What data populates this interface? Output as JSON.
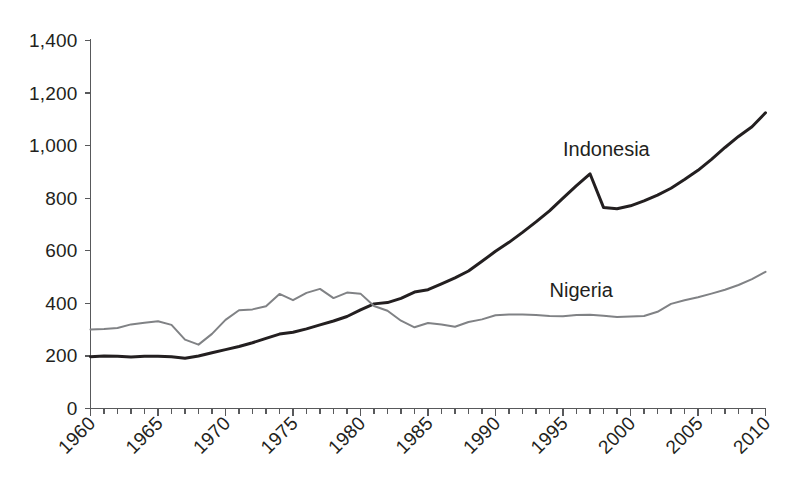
{
  "chart_data": {
    "type": "line",
    "title": "",
    "subtitle": "",
    "xlabel": "",
    "ylabel": "",
    "xlim": [
      1960,
      2010
    ],
    "ylim": [
      0,
      1400
    ],
    "grid": false,
    "legend_position": "inline-annotation",
    "y_ticks": [
      0,
      200,
      400,
      600,
      800,
      1000,
      1200,
      1400
    ],
    "y_tick_labels": [
      "0",
      "200",
      "400",
      "600",
      "800",
      "1,000",
      "1,200",
      "1,400"
    ],
    "x_ticks": [
      1960,
      1965,
      1970,
      1975,
      1980,
      1985,
      1990,
      1995,
      2000,
      2005,
      2010
    ],
    "x_tick_labels": [
      "1960",
      "1965",
      "1970",
      "1975",
      "1980",
      "1985",
      "1990",
      "1995",
      "2000",
      "2005",
      "2010"
    ],
    "x_minor_tick_step": 1,
    "x": [
      1960,
      1961,
      1962,
      1963,
      1964,
      1965,
      1966,
      1967,
      1968,
      1969,
      1970,
      1971,
      1972,
      1973,
      1974,
      1975,
      1976,
      1977,
      1978,
      1979,
      1980,
      1981,
      1982,
      1983,
      1984,
      1985,
      1986,
      1987,
      1988,
      1989,
      1990,
      1991,
      1992,
      1993,
      1994,
      1995,
      1996,
      1997,
      1998,
      1999,
      2000,
      2001,
      2002,
      2003,
      2004,
      2005,
      2006,
      2007,
      2008,
      2009,
      2010
    ],
    "series": [
      {
        "name": "Indonesia",
        "color": "#231f20",
        "stroke_width": 3.0,
        "label_x": 1995,
        "label_y": 960,
        "values": [
          197,
          200,
          199,
          196,
          199,
          199,
          197,
          191,
          200,
          212,
          224,
          236,
          250,
          267,
          283,
          290,
          303,
          318,
          333,
          350,
          375,
          398,
          403,
          419,
          443,
          452,
          474,
          497,
          523,
          560,
          598,
          632,
          670,
          710,
          752,
          800,
          848,
          893,
          765,
          760,
          771,
          790,
          812,
          838,
          871,
          906,
          948,
          993,
          1035,
          1072,
          1125
        ]
      },
      {
        "name": "Nigeria",
        "color": "#808285",
        "stroke_width": 2.0,
        "label_x": 1994,
        "label_y": 423,
        "values": [
          301,
          302,
          306,
          320,
          326,
          332,
          318,
          262,
          243,
          284,
          337,
          374,
          377,
          389,
          436,
          412,
          440,
          455,
          420,
          441,
          437,
          390,
          372,
          334,
          309,
          325,
          320,
          311,
          329,
          339,
          355,
          358,
          358,
          356,
          352,
          351,
          356,
          357,
          353,
          348,
          350,
          352,
          368,
          398,
          412,
          423,
          437,
          452,
          470,
          492,
          520
        ]
      }
    ],
    "annotations": [
      {
        "text": "Indonesia",
        "x": 1995,
        "y": 960
      },
      {
        "text": "Nigeria",
        "x": 1994,
        "y": 423
      }
    ]
  }
}
